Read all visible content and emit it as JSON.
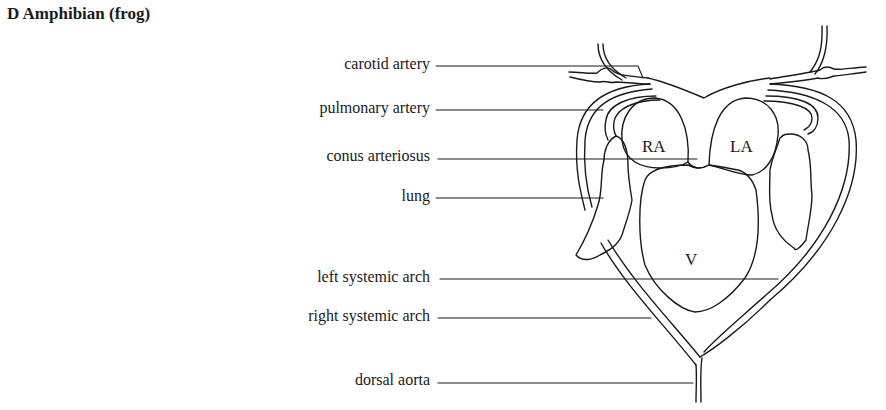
{
  "title": "D Amphibian (frog)",
  "labels": [
    {
      "id": "carotid-artery",
      "text": "carotid artery"
    },
    {
      "id": "pulmonary-artery",
      "text": "pulmonary artery"
    },
    {
      "id": "conus-arteriosus",
      "text": "conus arteriosus"
    },
    {
      "id": "lung",
      "text": "lung"
    },
    {
      "id": "left-systemic-arch",
      "text": "left systemic arch"
    },
    {
      "id": "right-systemic-arch",
      "text": "right systemic arch"
    },
    {
      "id": "dorsal-aorta",
      "text": "dorsal aorta"
    }
  ],
  "chambers": {
    "right_atrium": "RA",
    "left_atrium": "LA",
    "ventricle": "V"
  }
}
